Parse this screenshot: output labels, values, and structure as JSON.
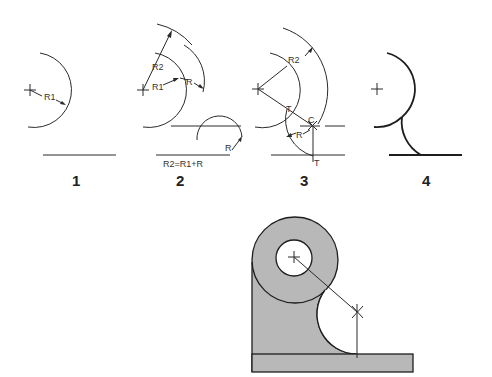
{
  "figure": {
    "steps": [
      {
        "number": "1",
        "labels": {
          "radius": "R1"
        }
      },
      {
        "number": "2",
        "labels": {
          "outer_radius": "R2",
          "inner_radius": "R1",
          "arc_radius": "R",
          "line_offset": "R",
          "formula": "R2=R1+R"
        }
      },
      {
        "number": "3",
        "labels": {
          "outer_radius": "R2",
          "tangent_point_circle": "T",
          "center": "C",
          "arc_radius": "R",
          "tangent_point_line": "T"
        }
      },
      {
        "number": "4",
        "labels": {}
      }
    ],
    "result": {
      "description": "Bracket part with shaded fillet between boss and base"
    },
    "colors": {
      "line": "#2a2a2a",
      "fill": "#b8b8b8",
      "background": "#ffffff"
    }
  }
}
